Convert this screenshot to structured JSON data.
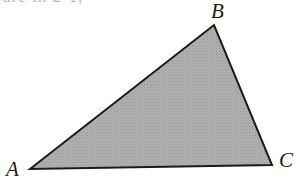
{
  "figure": {
    "caption_fragment": "are in 2-1,",
    "background_color": "#ffffff",
    "width": 303,
    "height": 188
  },
  "shape": {
    "name": "triangle",
    "fill_color": "#a9a9a9",
    "stroke_color": "#1a1a1a",
    "stroke_width": 2,
    "fill_pattern": "halftone-stipple",
    "points": "30,169 214,25 272,165",
    "vertices": [
      {
        "id": "A",
        "label": "A",
        "x": 30,
        "y": 169
      },
      {
        "id": "B",
        "label": "B",
        "x": 214,
        "y": 25
      },
      {
        "id": "C",
        "label": "C",
        "x": 272,
        "y": 165
      }
    ]
  }
}
